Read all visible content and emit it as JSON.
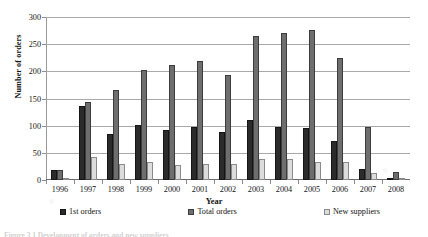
{
  "figure": {
    "caption_partial": "Figure 3.1  Development of orders and new suppliers"
  },
  "chart_data": {
    "type": "bar",
    "title": "",
    "xlabel": "Year",
    "ylabel": "Number of orders",
    "categories": [
      "1996",
      "1997",
      "1998",
      "1999",
      "2000",
      "2001",
      "2002",
      "2003",
      "2004",
      "2005",
      "2006",
      "2007",
      "2008"
    ],
    "series": [
      {
        "name": "1st orders",
        "color": "#2b2b2b",
        "values": [
          18,
          137,
          85,
          101,
          92,
          98,
          89,
          110,
          98,
          95,
          72,
          20,
          3
        ]
      },
      {
        "name": "Total orders",
        "color": "#6e6e6e",
        "values": [
          18,
          143,
          165,
          203,
          211,
          219,
          193,
          265,
          270,
          277,
          225,
          97,
          15
        ]
      },
      {
        "name": "New suppliers",
        "color": "#dcdcdc",
        "values": [
          3,
          42,
          30,
          33,
          28,
          30,
          30,
          38,
          38,
          33,
          33,
          12,
          1
        ]
      }
    ],
    "ylim": [
      0,
      300
    ],
    "yticks": [
      0,
      50,
      100,
      150,
      200,
      250,
      300
    ],
    "ytick_labels": [
      "0",
      "50",
      "100",
      "150",
      "200",
      "250",
      "300"
    ],
    "grid": true,
    "legend_position": "bottom"
  }
}
